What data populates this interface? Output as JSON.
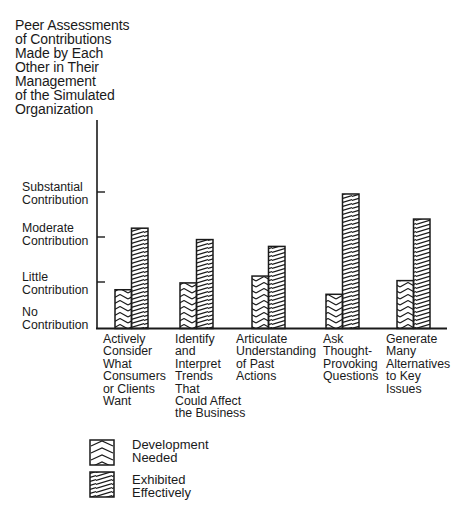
{
  "header": {
    "cut_off_title": "... Training Through Gaming ..."
  },
  "chart_data": {
    "type": "bar",
    "title": "Peer Assessments\nof Contributions\nMade by Each\nOther in Their\nManagement\nof the Simulated\nOrganization",
    "xlabel": "",
    "ylabel": "Peer Assessments of Contributions Made by Each Other in Their Management of the Simulated Organization",
    "ytick_labels": [
      "No\nContribution",
      "Little\nContribution",
      "Moderate\nContribution",
      "Substantial\nContribution"
    ],
    "ylim": [
      0,
      3
    ],
    "categories": [
      "Actively\nConsider\nWhat\nConsumers\nor Clients\nWant",
      "Identify\nand\nInterpret\nTrends\nThat\nCould Affect\nthe Business",
      "Articulate\nUnderstanding\nof Past\nActions",
      "Ask\nThought-\nProvoking\nQuestions",
      "Generate\nMany\nAlternatives\nto Key\nIssues"
    ],
    "series": [
      {
        "name": "Development Needed",
        "pattern": "chevron",
        "values": [
          0.85,
          1.0,
          1.15,
          0.75,
          1.05
        ]
      },
      {
        "name": "Exhibited Effectively",
        "pattern": "diagonal",
        "values": [
          2.2,
          1.95,
          1.8,
          2.95,
          2.4
        ]
      }
    ],
    "legend": {
      "position": "bottom-left",
      "entries": [
        "Development\nNeeded",
        "Exhibited\nEffectively"
      ]
    },
    "grid": false
  },
  "colors": {
    "ink": "#1a1a1a",
    "background": "#ffffff"
  }
}
